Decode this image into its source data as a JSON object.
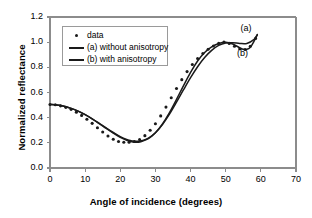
{
  "chart_data": {
    "type": "line",
    "title": "",
    "xlabel": "Angle of incidence (degrees)",
    "ylabel": "Normalized reflectance",
    "xlim": [
      0,
      70
    ],
    "ylim": [
      0,
      1.2
    ],
    "xticks": [
      "0",
      "10",
      "20",
      "30",
      "40",
      "50",
      "60",
      "70"
    ],
    "yticks": [
      "0.0",
      "0.2",
      "0.4",
      "0.6",
      "0.8",
      "1.0",
      "1.2"
    ],
    "grid": false,
    "legend_position": "upper-left-inside",
    "legend": [
      {
        "key": "dot",
        "label": "data"
      },
      {
        "key": "line",
        "label": "(a) without anisotropy"
      },
      {
        "key": "line",
        "label": "(b) with anisotropy"
      }
    ],
    "annotations": [
      {
        "text": "(a)",
        "x": 56.5,
        "y": 1.105
      },
      {
        "text": "(b)",
        "x": 55.5,
        "y": 0.905
      }
    ],
    "series": [
      {
        "name": "(a) without anisotropy",
        "x": [
          0,
          2,
          4,
          6,
          8,
          10,
          12,
          14,
          16,
          18,
          20,
          22,
          23,
          24,
          25,
          26,
          28,
          30,
          32,
          34,
          36,
          38,
          40,
          42,
          44,
          46,
          48,
          50,
          52,
          54,
          56,
          58,
          59
        ],
        "y": [
          0.505,
          0.5,
          0.49,
          0.474,
          0.452,
          0.424,
          0.391,
          0.355,
          0.318,
          0.282,
          0.249,
          0.225,
          0.217,
          0.213,
          0.212,
          0.216,
          0.237,
          0.28,
          0.345,
          0.428,
          0.523,
          0.622,
          0.718,
          0.805,
          0.878,
          0.935,
          0.974,
          0.993,
          0.995,
          0.99,
          0.99,
          1.02,
          1.06
        ]
      },
      {
        "name": "(b) with anisotropy",
        "x": [
          0,
          2,
          4,
          6,
          8,
          10,
          12,
          14,
          16,
          18,
          20,
          22,
          23,
          24,
          25,
          26,
          28,
          30,
          32,
          34,
          36,
          38,
          40,
          42,
          44,
          46,
          48,
          50,
          52,
          54,
          55,
          56,
          57,
          58,
          59
        ],
        "y": [
          0.505,
          0.5,
          0.49,
          0.474,
          0.452,
          0.424,
          0.39,
          0.353,
          0.314,
          0.277,
          0.243,
          0.218,
          0.21,
          0.205,
          0.205,
          0.21,
          0.233,
          0.28,
          0.35,
          0.44,
          0.545,
          0.655,
          0.76,
          0.85,
          0.918,
          0.963,
          0.99,
          1.0,
          0.985,
          0.955,
          0.943,
          0.943,
          0.96,
          1.005,
          1.06
        ]
      },
      {
        "name": "data",
        "marker": "dot",
        "x": [
          0,
          1.5,
          3,
          4.5,
          6,
          7.5,
          9,
          10.5,
          12,
          13.5,
          15,
          16.5,
          18,
          19.5,
          21,
          22.5,
          24,
          25.5,
          27,
          28.5,
          30,
          31.5,
          33,
          34.5,
          36,
          37.5,
          39,
          40.5,
          42,
          43.5,
          45,
          46.5,
          48,
          49.5,
          51,
          52.5,
          54,
          55.5,
          57,
          58.5
        ],
        "y": [
          0.505,
          0.503,
          0.494,
          0.482,
          0.466,
          0.444,
          0.418,
          0.388,
          0.355,
          0.32,
          0.286,
          0.254,
          0.228,
          0.211,
          0.205,
          0.205,
          0.21,
          0.226,
          0.257,
          0.3,
          0.352,
          0.414,
          0.484,
          0.558,
          0.632,
          0.702,
          0.766,
          0.822,
          0.87,
          0.91,
          0.944,
          0.97,
          0.99,
          1.0,
          0.99,
          0.968,
          0.948,
          0.942,
          0.968,
          1.03
        ]
      }
    ],
    "colors": {
      "curve": "#1a1a1a",
      "axis": "#8c8c8c",
      "text": "#000000",
      "background": "#ffffff"
    }
  }
}
